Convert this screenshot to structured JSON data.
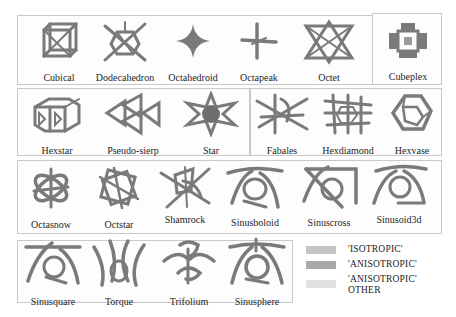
{
  "figure": {
    "panels": [
      {
        "id": "panel-a",
        "cells": [
          {
            "label": "Cubical",
            "icon": "cubical-lattice-icon"
          },
          {
            "label": "Dodecahedron",
            "icon": "dodecahedron-lattice-icon"
          },
          {
            "label": "Octahedroid",
            "icon": "octahedroid-lattice-icon"
          },
          {
            "label": "Octapeak",
            "icon": "octapeak-lattice-icon"
          },
          {
            "label": "Octet",
            "icon": "octet-lattice-icon"
          }
        ]
      },
      {
        "id": "panel-b",
        "cells": [
          {
            "label": "Cubeplex",
            "icon": "cubeplex-lattice-icon"
          }
        ]
      },
      {
        "id": "panel-c",
        "cells": [
          {
            "label": "Hexstar",
            "icon": "hexstar-lattice-icon"
          },
          {
            "label": "Pseudo-sierp",
            "icon": "pseudo-sierp-lattice-icon"
          },
          {
            "label": "Star",
            "icon": "star-lattice-icon"
          }
        ]
      },
      {
        "id": "panel-d",
        "cells": [
          {
            "label": "Fabales",
            "icon": "fabales-lattice-icon"
          },
          {
            "label": "Hexdiamond",
            "icon": "hexdiamond-lattice-icon"
          },
          {
            "label": "Hexvase",
            "icon": "hexvase-lattice-icon"
          }
        ]
      },
      {
        "id": "panel-e",
        "cells": [
          {
            "label": "Octasnow",
            "icon": "octasnow-lattice-icon"
          },
          {
            "label": "Octstar",
            "icon": "octstar-lattice-icon"
          },
          {
            "label": "Shamrock",
            "icon": "shamrock-lattice-icon"
          },
          {
            "label": "Sinusboloid",
            "icon": "sinusboloid-lattice-icon"
          },
          {
            "label": "Sinuscross",
            "icon": "sinuscross-lattice-icon"
          },
          {
            "label": "Sinusoid3d",
            "icon": "sinusoid3d-lattice-icon"
          }
        ]
      },
      {
        "id": "panel-f",
        "cells": [
          {
            "label": "Sinusquare",
            "icon": "sinusquare-lattice-icon"
          },
          {
            "label": "Torque",
            "icon": "torque-lattice-icon"
          },
          {
            "label": "Trifolium",
            "icon": "trifolium-lattice-icon"
          },
          {
            "label": "Sinusphere",
            "icon": "sinusphere-lattice-icon"
          }
        ]
      }
    ],
    "legend": [
      {
        "label": "'ISOTROPIC'",
        "color": "#c4c4c4"
      },
      {
        "label": "'ANISOTROPIC'",
        "color": "#a9a9a9"
      },
      {
        "label": "'ANISOTROPIC'",
        "label2": "OTHER",
        "color": "#e2e2e2"
      }
    ],
    "colors": {
      "panel_border": "#c9c9c9",
      "strut": "#7a7a7a",
      "background": "#ffffff"
    }
  }
}
